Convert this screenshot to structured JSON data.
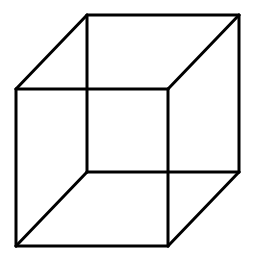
{
  "figure": {
    "type": "necker-cube",
    "background": "#ffffff",
    "stroke_color": "#000000",
    "stroke_width": 3,
    "vertices": {
      "front_tl": [
        16,
        89
      ],
      "front_tr": [
        168,
        89
      ],
      "front_bl": [
        16,
        246
      ],
      "front_br": [
        168,
        246
      ],
      "back_tl": [
        87,
        15
      ],
      "back_tr": [
        239,
        15
      ],
      "back_bl": [
        87,
        172
      ],
      "back_br": [
        239,
        172
      ]
    },
    "edges": [
      [
        "front_tl",
        "front_tr"
      ],
      [
        "front_tr",
        "front_br"
      ],
      [
        "front_br",
        "front_bl"
      ],
      [
        "front_bl",
        "front_tl"
      ],
      [
        "back_tl",
        "back_tr"
      ],
      [
        "back_tr",
        "back_br"
      ],
      [
        "back_br",
        "back_bl"
      ],
      [
        "back_bl",
        "back_tl"
      ],
      [
        "front_tl",
        "back_tl"
      ],
      [
        "front_tr",
        "back_tr"
      ],
      [
        "front_bl",
        "back_bl"
      ],
      [
        "front_br",
        "back_br"
      ]
    ]
  }
}
